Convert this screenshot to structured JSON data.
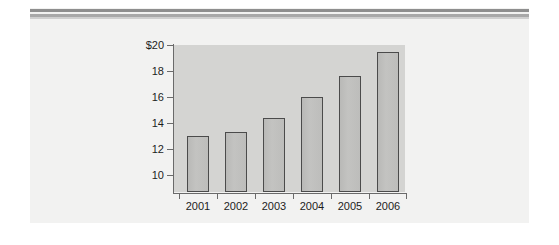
{
  "figure": {
    "background_color": "#ffffff",
    "panel_color": "#f2f2f1",
    "rule_color": "#8e8e8e",
    "rule_secondary_color": "#a8a8a8"
  },
  "chart_data": {
    "type": "bar",
    "title": "",
    "subtitle": "",
    "xlabel": "",
    "ylabel": "",
    "categories": [
      "2001",
      "2002",
      "2003",
      "2004",
      "2005",
      "2006"
    ],
    "values": [
      13.0,
      13.3,
      14.4,
      16.0,
      17.6,
      19.5
    ],
    "ylim": [
      8.7,
      20
    ],
    "yticks": [
      10,
      12,
      14,
      16,
      18,
      20
    ],
    "ytick_labels": [
      "10",
      "12",
      "14",
      "16",
      "18",
      "$20"
    ],
    "grid": false,
    "legend": null,
    "plot_background": "#d4d4d2",
    "bar_fill": "#bfbfbd",
    "bar_edge": "#4b4b4b",
    "axis_color": "#6a6a6a",
    "annotations": []
  }
}
